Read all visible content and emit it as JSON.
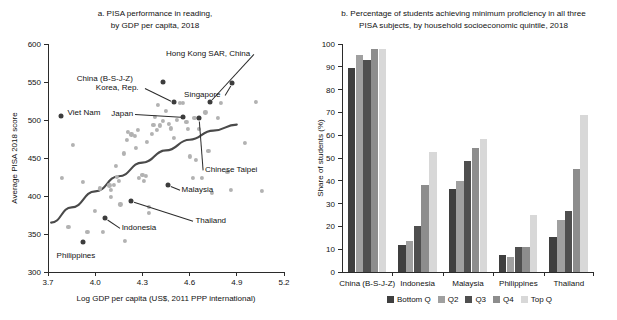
{
  "figure": {
    "background": "#ffffff"
  },
  "chart_data": [
    {
      "type": "scatter",
      "panel": "a",
      "title": "a. PISA performance in reading,",
      "title_line2": "by GDP per capita, 2018",
      "xlabel": "Log GDP per capita (US$, 2011 PPP international)",
      "ylabel": "Average PISA 2018 score",
      "xlim": [
        3.7,
        5.2
      ],
      "ylim": [
        300,
        600
      ],
      "xticks": [
        "3.7",
        "4.0",
        "4.3",
        "4.6",
        "4.9",
        "5.2"
      ],
      "xtick_values": [
        3.7,
        4.0,
        4.3,
        4.6,
        4.9,
        5.2
      ],
      "yticks": [
        "300",
        "350",
        "400",
        "450",
        "500",
        "550",
        "600"
      ],
      "ytick_values": [
        300,
        350,
        400,
        450,
        500,
        550,
        600
      ],
      "grid": false,
      "legend": "none",
      "colors": {
        "highlight": "#3c3c3c",
        "other": "#b2b2b2",
        "trend": "#4a4a4a"
      },
      "highlighted_points": [
        {
          "name": "Viet Nam",
          "x": 3.78,
          "y": 505,
          "label_dx": 7,
          "label_dy": -3,
          "leader": false
        },
        {
          "name": "China (B-S-J-Z)",
          "x": 4.43,
          "y": 550,
          "label_dx": -86,
          "label_dy": -3,
          "leader": false
        },
        {
          "name": "Korea, Rep.",
          "x": 4.5,
          "y": 524,
          "label_dx": -78,
          "label_dy": -14,
          "leader": true
        },
        {
          "name": "Japan",
          "x": 4.56,
          "y": 504,
          "label_dx": -72,
          "label_dy": -3,
          "leader": true
        },
        {
          "name": "Hong Kong SAR, China",
          "x": 4.73,
          "y": 524,
          "label_dx": -44,
          "label_dy": -48,
          "leader": true
        },
        {
          "name": "Singapore",
          "x": 4.87,
          "y": 549,
          "label_dx": -48,
          "label_dy": 12,
          "leader": true
        },
        {
          "name": "Chinese Taipei",
          "x": 4.66,
          "y": 503,
          "label_dx": 6,
          "label_dy": 52,
          "leader": true
        },
        {
          "name": "Malaysia",
          "x": 4.46,
          "y": 415,
          "label_dx": 14,
          "label_dy": 5,
          "leader": true
        },
        {
          "name": "Thailand",
          "x": 4.23,
          "y": 393,
          "label_dx": 64,
          "label_dy": 20,
          "leader": true
        },
        {
          "name": "Indonesia",
          "x": 4.06,
          "y": 371,
          "label_dx": 17,
          "label_dy": 10,
          "leader": true
        },
        {
          "name": "Philippines",
          "x": 3.92,
          "y": 340,
          "label_dx": -26,
          "label_dy": 14,
          "leader": false
        }
      ],
      "other_points": [
        {
          "x": 3.86,
          "y": 467
        },
        {
          "x": 3.79,
          "y": 424
        },
        {
          "x": 3.92,
          "y": 419
        },
        {
          "x": 3.83,
          "y": 359
        },
        {
          "x": 3.95,
          "y": 353
        },
        {
          "x": 4.0,
          "y": 380
        },
        {
          "x": 4.05,
          "y": 353
        },
        {
          "x": 4.03,
          "y": 410
        },
        {
          "x": 4.09,
          "y": 414
        },
        {
          "x": 4.1,
          "y": 408
        },
        {
          "x": 4.1,
          "y": 399
        },
        {
          "x": 4.12,
          "y": 415
        },
        {
          "x": 4.13,
          "y": 440
        },
        {
          "x": 4.14,
          "y": 425
        },
        {
          "x": 4.15,
          "y": 420
        },
        {
          "x": 4.16,
          "y": 389
        },
        {
          "x": 4.19,
          "y": 341
        },
        {
          "x": 4.18,
          "y": 456
        },
        {
          "x": 4.2,
          "y": 474
        },
        {
          "x": 4.21,
          "y": 484
        },
        {
          "x": 4.23,
          "y": 481
        },
        {
          "x": 4.25,
          "y": 479
        },
        {
          "x": 4.26,
          "y": 463
        },
        {
          "x": 4.27,
          "y": 487
        },
        {
          "x": 4.28,
          "y": 424
        },
        {
          "x": 4.3,
          "y": 428
        },
        {
          "x": 4.31,
          "y": 420
        },
        {
          "x": 4.32,
          "y": 426
        },
        {
          "x": 4.33,
          "y": 471
        },
        {
          "x": 4.34,
          "y": 386
        },
        {
          "x": 4.34,
          "y": 378
        },
        {
          "x": 4.36,
          "y": 482
        },
        {
          "x": 4.37,
          "y": 494
        },
        {
          "x": 4.38,
          "y": 504
        },
        {
          "x": 4.39,
          "y": 487
        },
        {
          "x": 4.4,
          "y": 520
        },
        {
          "x": 4.41,
          "y": 493
        },
        {
          "x": 4.43,
          "y": 499
        },
        {
          "x": 4.45,
          "y": 512
        },
        {
          "x": 4.47,
          "y": 495
        },
        {
          "x": 4.48,
          "y": 489
        },
        {
          "x": 4.5,
          "y": 476
        },
        {
          "x": 4.52,
          "y": 500
        },
        {
          "x": 4.54,
          "y": 523
        },
        {
          "x": 4.56,
          "y": 522
        },
        {
          "x": 4.58,
          "y": 498
        },
        {
          "x": 4.59,
          "y": 488
        },
        {
          "x": 4.6,
          "y": 452
        },
        {
          "x": 4.62,
          "y": 424
        },
        {
          "x": 4.63,
          "y": 503
        },
        {
          "x": 4.64,
          "y": 448
        },
        {
          "x": 4.66,
          "y": 488
        },
        {
          "x": 4.68,
          "y": 424
        },
        {
          "x": 4.7,
          "y": 510
        },
        {
          "x": 4.72,
          "y": 459
        },
        {
          "x": 4.74,
          "y": 404
        },
        {
          "x": 4.78,
          "y": 503
        },
        {
          "x": 4.8,
          "y": 523
        },
        {
          "x": 4.84,
          "y": 432
        },
        {
          "x": 4.86,
          "y": 408
        },
        {
          "x": 4.95,
          "y": 470
        },
        {
          "x": 5.06,
          "y": 407
        },
        {
          "x": 5.02,
          "y": 524
        }
      ],
      "trend_line": [
        {
          "x": 3.72,
          "y": 365
        },
        {
          "x": 3.85,
          "y": 385
        },
        {
          "x": 4.0,
          "y": 406
        },
        {
          "x": 4.15,
          "y": 426
        },
        {
          "x": 4.3,
          "y": 444
        },
        {
          "x": 4.45,
          "y": 460
        },
        {
          "x": 4.6,
          "y": 474
        },
        {
          "x": 4.75,
          "y": 486
        },
        {
          "x": 4.9,
          "y": 494
        }
      ]
    },
    {
      "type": "bar",
      "panel": "b",
      "title": "b. Percentage of students achieving minimum proficiency in all three",
      "title_line2": "PISA subjects, by household socioeconomic quintile, 2018",
      "xlabel": "",
      "ylabel": "Share of students (%)",
      "ylim": [
        0,
        100
      ],
      "yticks": [
        "0",
        "10",
        "20",
        "30",
        "40",
        "50",
        "60",
        "70",
        "80",
        "90",
        "100"
      ],
      "ytick_values": [
        0,
        10,
        20,
        30,
        40,
        50,
        60,
        70,
        80,
        90,
        100
      ],
      "grid": false,
      "legend_position": "bottom",
      "categories": [
        "China (B-S-J-Z)",
        "Indonesia",
        "Malaysia",
        "Philippines",
        "Thailand"
      ],
      "series": [
        {
          "name": "Bottom Q",
          "color": "#3f3f3f",
          "values": [
            89.4,
            12.0,
            36.4,
            7.6,
            15.2
          ]
        },
        {
          "name": "Q2",
          "color": "#a0a0a0",
          "values": [
            95.2,
            13.8,
            39.8,
            6.6,
            22.9
          ]
        },
        {
          "name": "Q3",
          "color": "#4f4f4f",
          "values": [
            93.2,
            20.1,
            48.9,
            11.0,
            26.7
          ]
        },
        {
          "name": "Q4",
          "color": "#8d8d8d",
          "values": [
            97.6,
            38.0,
            54.3,
            10.9,
            45.4
          ]
        },
        {
          "name": "Top Q",
          "color": "#d8d8d8",
          "values": [
            97.6,
            52.7,
            58.5,
            25.2,
            68.8
          ]
        }
      ]
    }
  ]
}
